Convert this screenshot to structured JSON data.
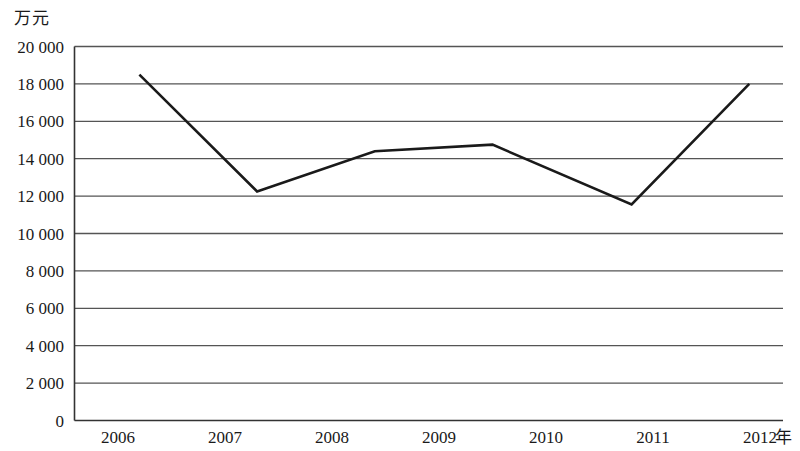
{
  "chart_data": {
    "type": "line",
    "title": "",
    "subtitle": "",
    "xlabel": "年",
    "ylabel": "万元",
    "ylim": [
      0,
      20000
    ],
    "xlim": [
      2006,
      2012
    ],
    "grid": true,
    "legend": null,
    "y_ticks": [
      {
        "value": 20000,
        "label": "20 000"
      },
      {
        "value": 18000,
        "label": "18 000"
      },
      {
        "value": 16000,
        "label": "16 000"
      },
      {
        "value": 14000,
        "label": "14 000"
      },
      {
        "value": 12000,
        "label": "12 000"
      },
      {
        "value": 10000,
        "label": "10 000"
      },
      {
        "value": 8000,
        "label": "8 000"
      },
      {
        "value": 6000,
        "label": "6 000"
      },
      {
        "value": 4000,
        "label": "4 000"
      },
      {
        "value": 2000,
        "label": "2 000"
      },
      {
        "value": 0,
        "label": "0"
      }
    ],
    "x_ticks": [
      {
        "value": 2006,
        "label": "2006"
      },
      {
        "value": 2007,
        "label": "2007"
      },
      {
        "value": 2008,
        "label": "2008"
      },
      {
        "value": 2009,
        "label": "2009"
      },
      {
        "value": 2010,
        "label": "2010"
      },
      {
        "value": 2011,
        "label": "2011"
      },
      {
        "value": 2012,
        "label": "2012"
      }
    ],
    "series": [
      {
        "name": "",
        "color": "#1a1a1a",
        "x": [
          2006.2,
          2007.3,
          2008.4,
          2009.5,
          2010.8,
          2011.9
        ],
        "values": [
          18500,
          12250,
          14400,
          14750,
          11550,
          18000
        ]
      }
    ]
  },
  "chart_style": {
    "line_color": "#1a1a1a",
    "grid_color": "#555555",
    "axis_color": "#333333",
    "background": "#ffffff"
  }
}
